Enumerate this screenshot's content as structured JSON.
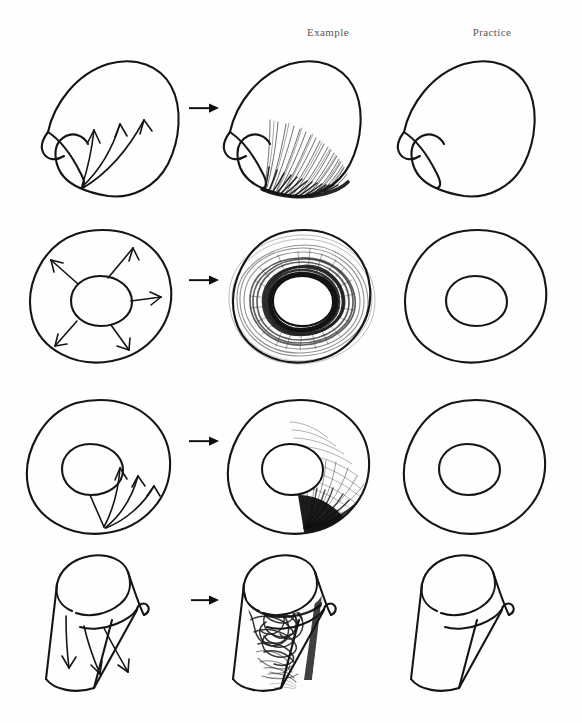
{
  "page": {
    "background_color": "#fefefe",
    "ink_color": "#151515",
    "header_color": "#585858",
    "width": 582,
    "height": 723
  },
  "columns": {
    "direction_label": "",
    "example_label": "Example",
    "practice_label": "Practice"
  },
  "transition_arrow": {
    "icon": "arrow-right-icon",
    "glyph": "→",
    "color": "#0d0d0d"
  },
  "rows": [
    {
      "index": 1,
      "name": "curved-shell-form",
      "shape": "curved shell / leaf form with concave hooked notch at left",
      "direction_hint": "three curved arrows sweeping upward from the lower edge",
      "arrow_count": 3,
      "example_shading": "dense parallel hatch lines fanning up from the bottom edge, darkest along the lower contour",
      "practice_state": "empty outline"
    },
    {
      "index": 2,
      "name": "torus-centered-hole",
      "shape": "rounded torus / donut with centered inner circle",
      "direction_hint": "five arrows radiating outward from the inner circle",
      "arrow_count": 5,
      "example_shading": "concentric radial strokes orbiting the hole, darkest at the inner rim and fading outward",
      "practice_state": "empty outline"
    },
    {
      "index": 3,
      "name": "torus-offset-hole",
      "shape": "torus / donut with inner circle offset up and left",
      "direction_hint": "three curved arrows sweeping from the lower-left radius toward the upper right",
      "arrow_count": 3,
      "example_shading": "cross-hatched sweep filling the right half, solid black wedge at the lower right of the hole",
      "practice_state": "empty outline"
    },
    {
      "index": 4,
      "name": "tilted-cut-cylinder",
      "shape": "tilted cylindrical cup with an angled cut opening and curled lip",
      "direction_hint": "three straight arrows pointing down into the vessel",
      "arrow_count": 3,
      "example_shading": "tangled scribble fill inside the hollow interior, darkest under the rim",
      "practice_state": "empty outline"
    }
  ]
}
